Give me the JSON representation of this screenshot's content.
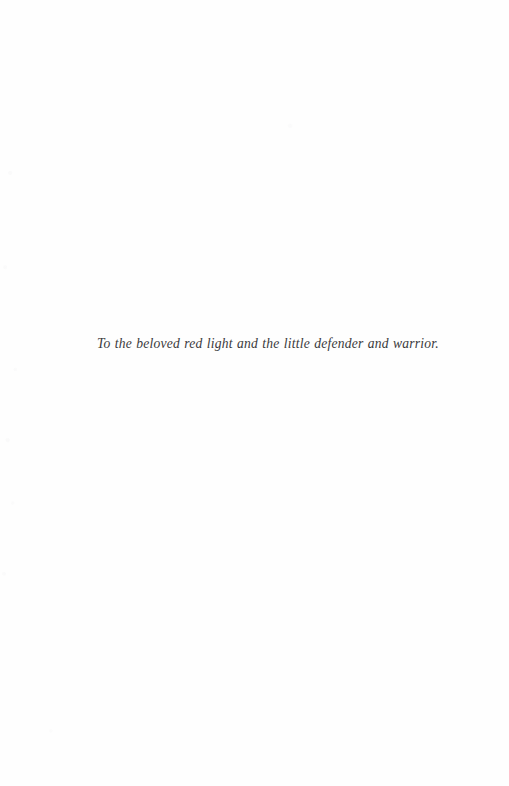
{
  "page": {
    "kind": "book-dedication-page",
    "background_color": "#fefefe",
    "ink_color": "#3a3a3c",
    "width": 509,
    "height": 786
  },
  "dedication": {
    "text": "To the beloved red light and the little defender and warrior."
  }
}
